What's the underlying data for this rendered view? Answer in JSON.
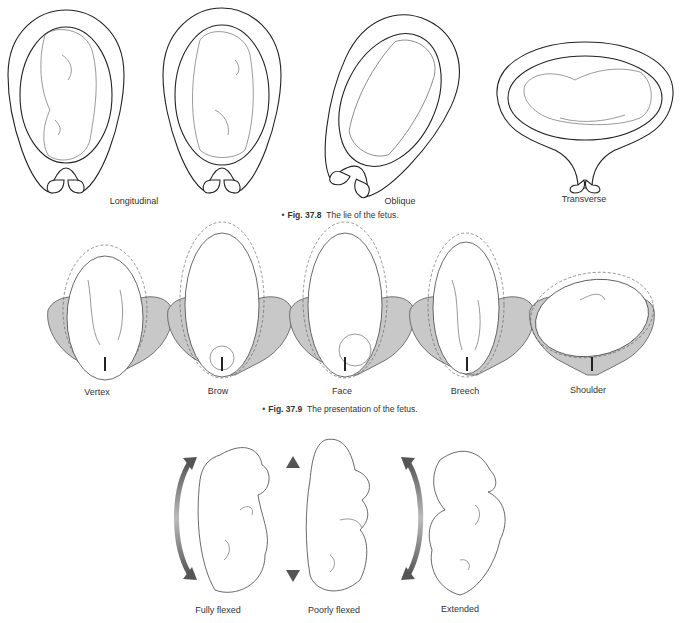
{
  "figure_37_8": {
    "labels": [
      "Longitudinal",
      "Oblique",
      "Transverse"
    ],
    "caption_fig": "Fig. 37.8",
    "caption_text": "The lie of the fetus."
  },
  "figure_37_9": {
    "labels": [
      "Vertex",
      "Brow",
      "Face",
      "Breech",
      "Shoulder"
    ],
    "caption_fig": "Fig. 37.9",
    "caption_text": "The presentation of the fetus."
  },
  "figure_attitude": {
    "labels": [
      "Fully flexed",
      "Poorly flexed",
      "Extended"
    ]
  },
  "colors": {
    "pelvis_fill": "#c8c8c8",
    "arrow_gradient_dark": "#555555",
    "arrow_gradient_light": "#bbbbbb"
  }
}
